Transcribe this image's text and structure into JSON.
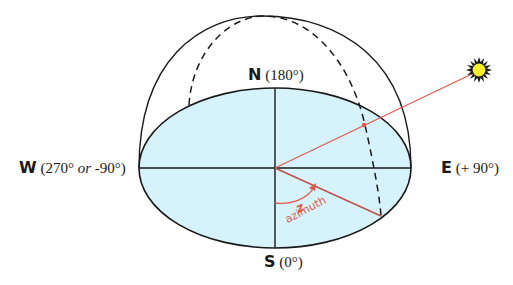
{
  "diagram": {
    "directions": {
      "north": {
        "letter": "N",
        "value": "(180°)"
      },
      "south": {
        "letter": "S",
        "value": "(0°)"
      },
      "east": {
        "letter": "E",
        "value": "(+ 90°)"
      },
      "west": {
        "letter": "W",
        "value": "(270°",
        "or": "or",
        "alt": "-90°)"
      }
    },
    "angle": {
      "symbol": "z",
      "label": "azimuth"
    },
    "icons": {
      "sun": "sun-icon"
    },
    "colors": {
      "horizon_fill": "#d6f2fa",
      "outline": "#1a1a1a",
      "sun_ray": "#e05a4a",
      "sun_fill": "#f5ee2a"
    }
  }
}
